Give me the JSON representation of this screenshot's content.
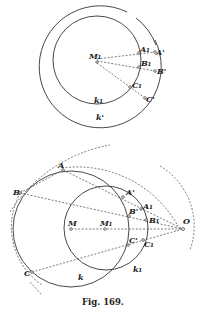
{
  "figure": {
    "caption": "Fig. 169.",
    "top_diagram": {
      "labels": {
        "M1": "M₁",
        "A1": "A₁",
        "B1": "B₁",
        "C1": "C₁",
        "A_prime": "A'",
        "B_prime": "B'",
        "C_prime": "C'",
        "k1": "k₁",
        "k_prime": "k'"
      }
    },
    "bottom_diagram": {
      "labels": {
        "A": "A",
        "B": "B",
        "C": "C",
        "A_prime": "A'",
        "B_prime": "B'",
        "C_prime": "C'",
        "A1": "A₁",
        "B1": "B₁",
        "C1": "C₁",
        "M": "M",
        "M1": "M₁",
        "O": "O",
        "k": "k",
        "k1": "k₁"
      }
    }
  }
}
